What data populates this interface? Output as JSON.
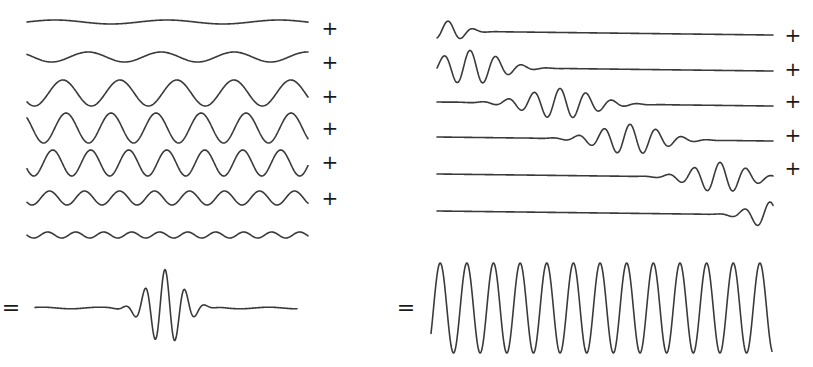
{
  "figure": {
    "stroke_color": "#3a3a3a",
    "background": "#ffffff"
  },
  "left_panel": {
    "name": "sine-components-to-wave-packet",
    "x_start": 27,
    "x_end": 308,
    "components": [
      {
        "label": "component-1",
        "center_y": 22,
        "amplitude": 2,
        "period": 112,
        "phase": 0.0,
        "operator": "+"
      },
      {
        "label": "component-2",
        "center_y": 57,
        "amplitude": 5,
        "period": 73,
        "phase": 2.6,
        "operator": "+"
      },
      {
        "label": "component-3",
        "center_y": 93,
        "amplitude": 13,
        "period": 57,
        "phase": 3.9,
        "operator": "+"
      },
      {
        "label": "component-4",
        "center_y": 128,
        "amplitude": 15,
        "period": 45,
        "phase": 2.4,
        "operator": "+"
      },
      {
        "label": "component-5",
        "center_y": 163,
        "amplitude": 13,
        "period": 38,
        "phase": 3.6,
        "operator": "+"
      },
      {
        "label": "component-6",
        "center_y": 198,
        "amplitude": 7,
        "period": 35,
        "phase": 3.8,
        "operator": "+"
      },
      {
        "label": "component-7",
        "center_y": 235,
        "amplitude": 3,
        "period": 28,
        "phase": 3.2,
        "operator": ""
      }
    ],
    "operators": [
      {
        "symbol": "+",
        "x": 330,
        "y": 28
      },
      {
        "symbol": "+",
        "x": 330,
        "y": 62
      },
      {
        "symbol": "+",
        "x": 330,
        "y": 96
      },
      {
        "symbol": "+",
        "x": 330,
        "y": 128
      },
      {
        "symbol": "+",
        "x": 330,
        "y": 162
      },
      {
        "symbol": "+",
        "x": 330,
        "y": 198
      }
    ],
    "result": {
      "equals": {
        "symbol": "=",
        "x": 11,
        "y": 308
      },
      "type": "wave-packet",
      "x_start": 35,
      "x_end": 297,
      "center_y": 308,
      "peak_x": 165,
      "amplitude": 38,
      "period": 20,
      "envelope_width": 24
    }
  },
  "right_panel": {
    "name": "wave-packets-to-sine",
    "x_start": 437,
    "x_end": 773,
    "components": [
      {
        "label": "packet-1",
        "center_y": 31,
        "peak_x": 448,
        "amplitude": 10,
        "envelope_width": 22,
        "period": 26,
        "operator": "+"
      },
      {
        "label": "packet-2",
        "center_y": 67,
        "peak_x": 470,
        "amplitude": 17,
        "envelope_width": 40,
        "period": 26,
        "operator": "+"
      },
      {
        "label": "packet-3",
        "center_y": 102,
        "peak_x": 560,
        "amplitude": 15,
        "envelope_width": 45,
        "period": 26,
        "operator": "+"
      },
      {
        "label": "packet-4",
        "center_y": 137,
        "peak_x": 630,
        "amplitude": 15,
        "envelope_width": 42,
        "period": 26,
        "operator": "+"
      },
      {
        "label": "packet-5",
        "center_y": 174,
        "peak_x": 720,
        "amplitude": 15,
        "envelope_width": 38,
        "period": 26,
        "operator": "+"
      },
      {
        "label": "packet-6",
        "center_y": 211,
        "peak_x": 770,
        "amplitude": 13,
        "envelope_width": 28,
        "period": 26,
        "operator": ""
      }
    ],
    "operators": [
      {
        "symbol": "+",
        "x": 793,
        "y": 35
      },
      {
        "symbol": "+",
        "x": 793,
        "y": 69
      },
      {
        "symbol": "+",
        "x": 793,
        "y": 101
      },
      {
        "symbol": "+",
        "x": 793,
        "y": 135
      },
      {
        "symbol": "+",
        "x": 793,
        "y": 168
      }
    ],
    "result": {
      "equals": {
        "symbol": "=",
        "x": 406,
        "y": 308
      },
      "type": "sine-wave",
      "x_start": 431,
      "x_end": 772,
      "center_y": 308,
      "amplitude": 45,
      "cycles": 12.8,
      "peaks": 13
    }
  }
}
